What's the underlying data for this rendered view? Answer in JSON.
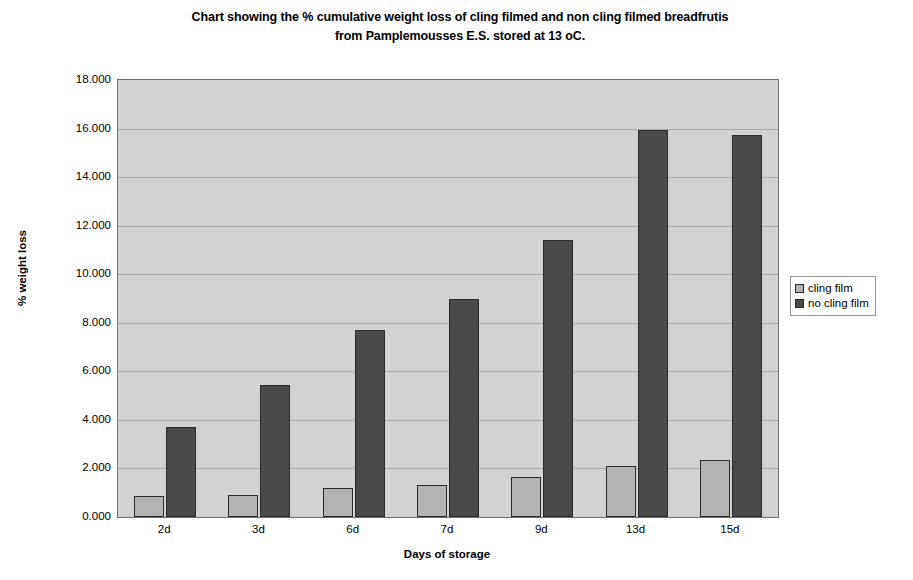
{
  "chart_data": {
    "type": "bar",
    "title": "Chart showing the % cumulative weight loss of cling filmed and non cling filmed breadfrutis from Pamplemousses E.S. stored at 13 oC.",
    "title_lines": [
      "Chart showing the % cumulative weight loss of cling filmed and non cling filmed breadfrutis",
      "from Pamplemousses E.S. stored at 13 oC."
    ],
    "xlabel": "Days of storage",
    "ylabel": "% weight loss",
    "categories": [
      "2d",
      "3d",
      "6d",
      "7d",
      "9d",
      "13d",
      "15d"
    ],
    "ylim": [
      0,
      18
    ],
    "ytick_step": 2,
    "ytick_labels": [
      "0.000",
      "2.000",
      "4.000",
      "6.000",
      "8.000",
      "10.000",
      "12.000",
      "14.000",
      "16.000",
      "18.000"
    ],
    "ytick_values": [
      0,
      2,
      4,
      6,
      8,
      10,
      12,
      14,
      16,
      18
    ],
    "grid": true,
    "legend_position": "right",
    "series": [
      {
        "name": "cling film",
        "color": "#b3b3b3",
        "values": [
          0.85,
          0.92,
          1.2,
          1.33,
          1.65,
          2.1,
          2.35
        ]
      },
      {
        "name": "no cling film",
        "color": "#4a4a4a",
        "values": [
          3.7,
          5.45,
          7.7,
          9.0,
          11.4,
          15.95,
          15.75
        ]
      }
    ]
  }
}
